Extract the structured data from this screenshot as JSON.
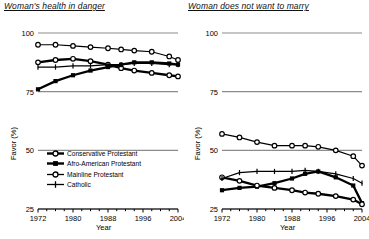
{
  "figure": {
    "y_axis_label": "Favor (%)",
    "x_axis_label": "Year",
    "y_ticks": [
      25,
      50,
      75,
      100
    ],
    "x_ticks": [
      1972,
      1980,
      1988,
      1996,
      2004
    ],
    "x_minor_step": 2,
    "ylim": [
      25,
      100
    ],
    "xlim": [
      1972,
      2004
    ]
  },
  "legend": {
    "position": "inside-left-panel-lower",
    "entries": [
      {
        "label": "Conservative Protestant",
        "marker": "open-circle",
        "line": "thick"
      },
      {
        "label": "Afro-American Protestant",
        "marker": "filled-square",
        "line": "thick"
      },
      {
        "label": "Mainline Protestant",
        "marker": "open-circle",
        "line": "thin"
      },
      {
        "label": "Catholic",
        "marker": "plus",
        "line": "thin"
      }
    ]
  },
  "chart_data": [
    {
      "type": "line",
      "panel": "left",
      "title": "Woman's health in danger",
      "xlabel": "Year",
      "ylabel": "Favor (%)",
      "xlim": [
        1972,
        2004
      ],
      "ylim": [
        25,
        100
      ],
      "yticks": [
        25,
        50,
        75,
        100
      ],
      "xticks": [
        1972,
        1980,
        1988,
        1996,
        2004
      ],
      "grid": "horizontal-at-yticks",
      "x": [
        1972,
        1976,
        1980,
        1984,
        1988,
        1991,
        1994,
        1998,
        2002,
        2004
      ],
      "series": [
        {
          "name": "Conservative Protestant",
          "marker": "open-circle",
          "line": "thick",
          "values": [
            87.5,
            88.5,
            89.0,
            88.0,
            86.5,
            85.0,
            84.0,
            83.0,
            82.0,
            81.5
          ]
        },
        {
          "name": "Afro-American Protestant",
          "marker": "filled-square",
          "line": "thick",
          "values": [
            76.0,
            79.5,
            82.0,
            84.0,
            85.5,
            86.5,
            87.5,
            87.5,
            87.0,
            86.5
          ]
        },
        {
          "name": "Mainline Protestant",
          "marker": "open-circle",
          "line": "thin",
          "values": [
            95.0,
            95.0,
            94.5,
            94.0,
            93.5,
            93.0,
            92.5,
            92.0,
            90.0,
            88.5
          ]
        },
        {
          "name": "Catholic",
          "marker": "plus",
          "line": "thin",
          "values": [
            85.5,
            85.5,
            86.0,
            86.0,
            86.5,
            86.5,
            87.0,
            87.0,
            86.5,
            86.5
          ]
        }
      ]
    },
    {
      "type": "line",
      "panel": "right",
      "title": "Woman does not want to marry",
      "xlabel": "Year",
      "ylabel": "Favor (%)",
      "xlim": [
        1972,
        2004
      ],
      "ylim": [
        25,
        100
      ],
      "yticks": [
        25,
        50,
        75,
        100
      ],
      "xticks": [
        1972,
        1980,
        1988,
        1996,
        2004
      ],
      "grid": "horizontal-at-yticks",
      "x": [
        1972,
        1976,
        1980,
        1984,
        1988,
        1991,
        1994,
        1998,
        2002,
        2004
      ],
      "series": [
        {
          "name": "Conservative Protestant",
          "marker": "open-circle",
          "line": "thin",
          "values": [
            57.0,
            55.5,
            53.5,
            52.0,
            52.0,
            52.0,
            51.5,
            50.0,
            47.5,
            43.5
          ]
        },
        {
          "name": "Afro-American Protestant",
          "marker": "filled-square",
          "line": "thick",
          "values": [
            33.0,
            34.0,
            34.5,
            36.0,
            38.0,
            40.0,
            41.0,
            38.5,
            35.0,
            27.5
          ]
        },
        {
          "name": "Mainline Protestant",
          "marker": "open-circle",
          "line": "thick",
          "values": [
            38.5,
            37.0,
            35.0,
            34.0,
            33.0,
            32.0,
            31.5,
            30.5,
            29.0,
            27.0
          ]
        },
        {
          "name": "Catholic",
          "marker": "plus",
          "line": "thin",
          "values": [
            38.0,
            40.5,
            41.0,
            41.0,
            41.0,
            41.5,
            41.0,
            40.0,
            38.0,
            36.0
          ]
        }
      ]
    }
  ]
}
